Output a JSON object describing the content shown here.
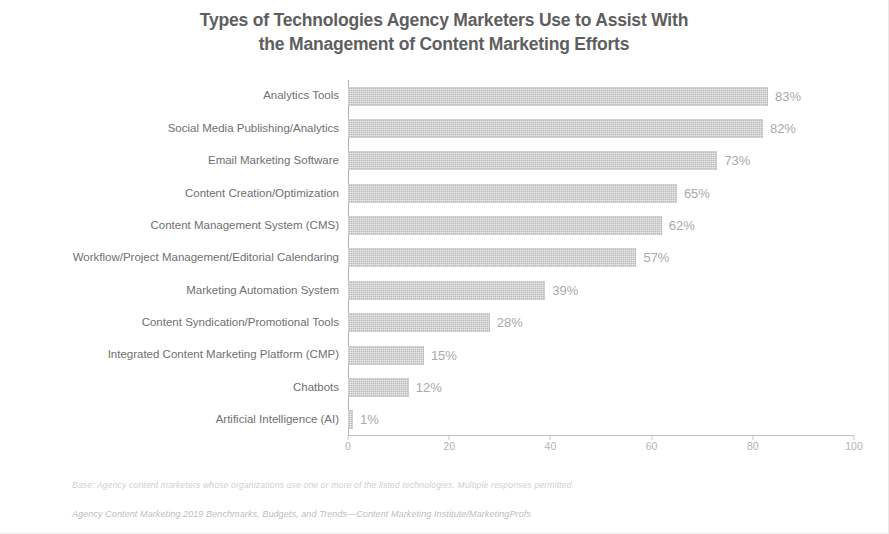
{
  "chart_data": {
    "type": "bar",
    "orientation": "horizontal",
    "title": "Types of Technologies Agency Marketers Use to Assist With the Management of Content Marketing Efforts",
    "title_lines": [
      "Types of Technologies Agency Marketers Use to Assist With",
      "the Management of Content Marketing Efforts"
    ],
    "xlabel": "",
    "ylabel": "",
    "xlim": [
      0,
      100
    ],
    "xticks": [
      0,
      20,
      40,
      60,
      80,
      100
    ],
    "xtick_labels": [
      "0",
      "20",
      "40",
      "60",
      "80",
      "100"
    ],
    "grid": false,
    "legend": false,
    "value_suffix": "%",
    "bar_color": "#bdbdbd",
    "label_color": "#a9a9a9",
    "categories": [
      "Analytics Tools",
      "Social Media Publishing/Analytics",
      "Email Marketing Software",
      "Content Creation/Optimization",
      "Content Management System (CMS)",
      "Workflow/Project Management/Editorial Calendaring",
      "Marketing Automation System",
      "Content Syndication/Promotional Tools",
      "Integrated Content Marketing Platform (CMP)",
      "Chatbots",
      "Artificial Intelligence (AI)"
    ],
    "values": [
      83,
      82,
      73,
      65,
      62,
      57,
      39,
      28,
      15,
      12,
      1
    ],
    "value_labels": [
      "83%",
      "82%",
      "73%",
      "65%",
      "62%",
      "57%",
      "39%",
      "28%",
      "15%",
      "12%",
      "1%"
    ]
  },
  "footnotes": {
    "base": "Base: Agency content marketers whose organizations use one or more of the listed technologies. Multiple responses permitted.",
    "source": "Agency Content Marketing 2019 Benchmarks, Budgets, and Trends—Content Marketing Institute/MarketingProfs"
  }
}
